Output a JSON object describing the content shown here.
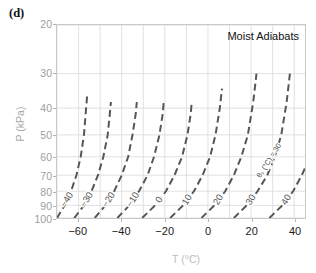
{
  "panel": {
    "label": "(d)"
  },
  "plot": {
    "title": "Moist  Adiabats",
    "annotation": "θₛ (°C) = 30"
  },
  "axes": {
    "xlabel": "T (°C)",
    "ylabel": "P (kPa)",
    "xticks": [
      "−60",
      "−40",
      "−20",
      "0",
      "20",
      "40"
    ],
    "xtick_values": [
      -60,
      -40,
      -20,
      0,
      20,
      40
    ],
    "yticks": [
      "20",
      "30",
      "40",
      "50",
      "60",
      "70",
      "80",
      "90",
      "100"
    ],
    "ytick_values": [
      20,
      30,
      40,
      50,
      60,
      70,
      80,
      90,
      100
    ],
    "xlim": [
      -70,
      45
    ],
    "ylim": [
      20,
      100
    ],
    "yscale": "log-inverted",
    "xgrid_step": 10
  },
  "chart_data": {
    "type": "line",
    "title": "Moist  Adiabats",
    "xlabel": "T (°C)",
    "ylabel": "P (kPa)",
    "xlim": [
      -70,
      45
    ],
    "ylim": [
      20,
      100
    ],
    "yscale": "log",
    "y_inverted": true,
    "grid": true,
    "legend": "inline-curve-labels",
    "annotations": [
      {
        "text": "θₛ (°C) = 30",
        "near_curve": "30",
        "rotation": -58
      }
    ],
    "curve_label_values": [
      "−40",
      "−30",
      "−20",
      "−10",
      "0",
      "10",
      "20",
      "30",
      "40"
    ],
    "series": [
      {
        "name": "−40",
        "theta_s": -40,
        "x": [
          -70,
          -66.5,
          -63.5,
          -61,
          -59,
          -57.5,
          -56.5,
          -56
        ],
        "y": [
          100,
          90,
          80,
          70,
          60,
          50,
          40,
          36
        ]
      },
      {
        "name": "−30",
        "theta_s": -30,
        "x": [
          -62,
          -57.5,
          -54,
          -51,
          -48.5,
          -46.5,
          -45.5,
          -45
        ],
        "y": [
          100,
          90,
          80,
          70,
          60,
          50,
          42,
          38
        ]
      },
      {
        "name": "−20",
        "theta_s": -20,
        "x": [
          -52.5,
          -47.5,
          -43.5,
          -40,
          -37,
          -35,
          -33.5,
          -33
        ],
        "y": [
          100,
          90,
          80,
          70,
          60,
          50,
          42,
          38
        ]
      },
      {
        "name": "−10",
        "theta_s": -10,
        "x": [
          -42,
          -36.5,
          -32,
          -28,
          -25,
          -22.5,
          -21,
          -20.5
        ],
        "y": [
          100,
          90,
          80,
          70,
          60,
          50,
          42,
          38
        ]
      },
      {
        "name": "0",
        "theta_s": 0,
        "x": [
          -30.5,
          -24.5,
          -19.5,
          -15.5,
          -12,
          -9.5,
          -8,
          -7.5
        ],
        "y": [
          100,
          90,
          80,
          70,
          60,
          50,
          42,
          38
        ]
      },
      {
        "name": "10",
        "theta_s": 10,
        "x": [
          -17.5,
          -11.5,
          -6.5,
          -2.5,
          1,
          3.5,
          5.5,
          6.5
        ],
        "y": [
          100,
          90,
          80,
          70,
          60,
          50,
          40,
          34
        ]
      },
      {
        "name": "20",
        "theta_s": 20,
        "x": [
          -3,
          3,
          8,
          12,
          15.5,
          18.5,
          21,
          22.5
        ],
        "y": [
          100,
          90,
          80,
          70,
          60,
          50,
          38,
          30
        ]
      },
      {
        "name": "30",
        "theta_s": 30,
        "x": [
          12,
          18,
          23,
          27.5,
          31,
          34,
          36.5,
          38
        ],
        "y": [
          100,
          90,
          80,
          70,
          60,
          50,
          38,
          30
        ]
      },
      {
        "name": "40",
        "theta_s": 40,
        "x": [
          28.5,
          34.5,
          39.5,
          43.5,
          45
        ],
        "y": [
          100,
          90,
          80,
          70,
          66
        ]
      }
    ]
  },
  "style": {
    "curve_color": "#555555",
    "grid_color": "#d9d9d9",
    "frame_color": "#c8c8c8",
    "xtick_label_color": "#1a1a1a",
    "ytick_label_color": "#9e9e9e"
  }
}
